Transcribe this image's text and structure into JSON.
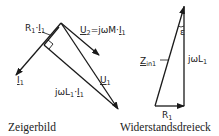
{
  "phasor_diagram": {
    "caption": "Zeigerbild",
    "labels": {
      "r1_i1": {
        "base": "R",
        "sub": "1",
        "mid": "·",
        "var": "I",
        "var_sub": "1"
      },
      "u2": {
        "base": "U",
        "sub": "2",
        "rest": "=jωM·",
        "var": "I",
        "var_sub": "1"
      },
      "i1": {
        "base": "I",
        "sub": "1"
      },
      "u1": {
        "base": "U",
        "sub": "1"
      },
      "jwl1_i1": {
        "base": "jωL",
        "sub": "1",
        "mid": "·",
        "var": "I",
        "var_sub": "1"
      }
    }
  },
  "impedance_triangle": {
    "caption": "Widerstandsdreieck",
    "labels": {
      "z": {
        "base": "Z",
        "sub": "in1"
      },
      "jwl1": {
        "base": "jωL",
        "sub": "1"
      },
      "r1": {
        "base": "R",
        "sub": "1"
      },
      "angle": "ε"
    }
  },
  "colors": {
    "stroke": "#1a1a1a",
    "background": "#ffffff"
  }
}
